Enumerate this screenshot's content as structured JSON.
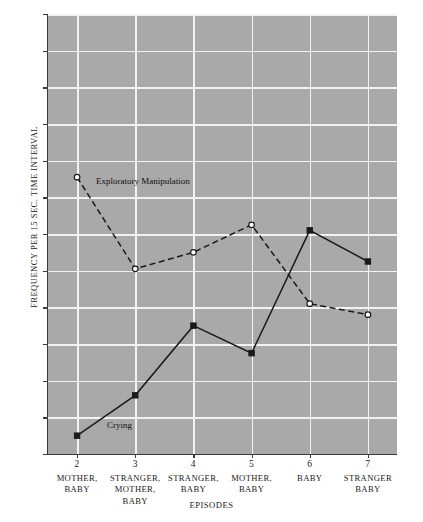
{
  "chart_data": {
    "type": "line",
    "title": "",
    "xlabel": "EPISODES",
    "ylabel": "FREQUENCY PER 15 SEC. TIME INTERVAL",
    "x": [
      2,
      3,
      4,
      5,
      6,
      7
    ],
    "categories": [
      "2",
      "3",
      "4",
      "5",
      "6",
      "7"
    ],
    "category_descriptions": [
      "MOTHER, BABY",
      "STRANGER, MOTHER, BABY",
      "STRANGER, BABY",
      "MOTHER, BABY",
      "BABY",
      "STRANGER BABY"
    ],
    "ylim": [
      0,
      12
    ],
    "xlim": [
      1.5,
      7.5
    ],
    "ytick_labels": [
      "12",
      "11",
      "10",
      "9",
      "8",
      "7",
      "6",
      "5",
      "4",
      "3",
      "2",
      "1",
      "0"
    ],
    "yticks": [
      12,
      11,
      10,
      9,
      8,
      7,
      6,
      5,
      4,
      3,
      2,
      1,
      0
    ],
    "grid": true,
    "legend_position": "inline-annotations",
    "plot_background": "#a9a9a9",
    "gridline_color": "#f2f2f2",
    "series": [
      {
        "name": "Exploratory Manipulation",
        "values": [
          7.55,
          5.05,
          5.5,
          6.25,
          4.1,
          3.8
        ],
        "marker": "open-circle",
        "line_style": "dashed",
        "color": "#1a1a1a"
      },
      {
        "name": "Crying",
        "values": [
          0.5,
          1.6,
          3.5,
          2.75,
          6.1,
          5.25
        ],
        "marker": "filled-square",
        "line_style": "solid",
        "color": "#1a1a1a"
      }
    ],
    "annotations": [
      {
        "text": "Exploratory Manipulation",
        "x": 2,
        "y": 7.55
      },
      {
        "text": "Crying",
        "x": 2,
        "y": 0.5
      }
    ]
  },
  "axis": {
    "y_labels": [
      "12",
      "11",
      "10",
      "9",
      "8",
      "7",
      "6",
      "5",
      "4",
      "3",
      "2",
      "1",
      "0"
    ],
    "y_title": "FREQUENCY PER 15 SEC. TIME INTERVAL",
    "x_title": "EPISODES",
    "x_groups": [
      {
        "num": "2",
        "lines": [
          "MOTHER,",
          "BABY"
        ]
      },
      {
        "num": "3",
        "lines": [
          "STRANGER,",
          "MOTHER,",
          "BABY"
        ]
      },
      {
        "num": "4",
        "lines": [
          "STRANGER,",
          "BABY"
        ]
      },
      {
        "num": "5",
        "lines": [
          "MOTHER,",
          "BABY"
        ]
      },
      {
        "num": "6",
        "lines": [
          "BABY"
        ]
      },
      {
        "num": "7",
        "lines": [
          "STRANGER",
          "BABY"
        ]
      }
    ]
  },
  "labels": {
    "exploratory": "Exploratory Manipulation",
    "crying": "Crying"
  }
}
